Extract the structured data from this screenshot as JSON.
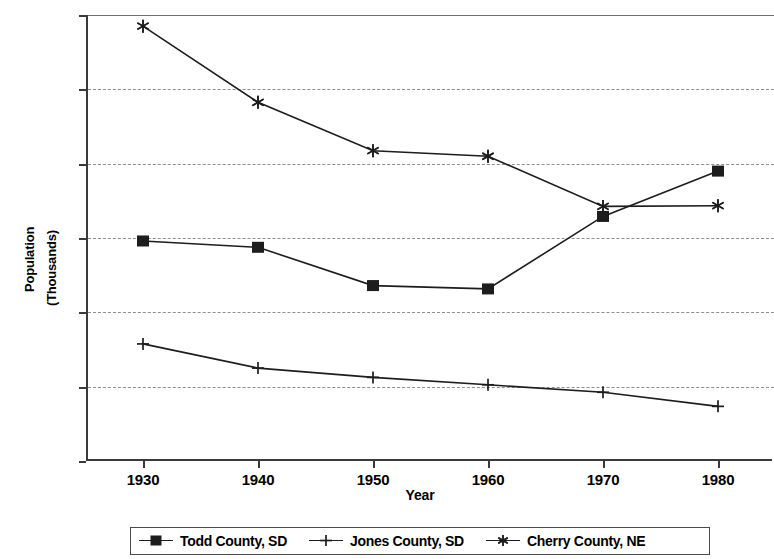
{
  "chart_data": {
    "type": "line",
    "title": "",
    "xlabel": "Year",
    "ylabel": "Population (Thousands)",
    "ylabel_lines": [
      "Population",
      "(Thousands)"
    ],
    "x": [
      1930,
      1940,
      1950,
      1960,
      1970,
      1980
    ],
    "xtick_labels": [
      "1930",
      "1940",
      "1950",
      "1960",
      "1970",
      "1980"
    ],
    "ytick_labels": [
      "0",
      "2",
      "4",
      "6",
      "8",
      "10",
      "12"
    ],
    "ytick_values": [
      0,
      2,
      4,
      6,
      8,
      10,
      12
    ],
    "ylim": [
      0,
      12
    ],
    "xlim": [
      1925,
      1985
    ],
    "grid": true,
    "grid_axis": "y",
    "legend_position": "bottom",
    "series": [
      {
        "name": "Todd County, SD",
        "marker": "filled-square",
        "values": [
          5.92,
          5.75,
          4.72,
          4.63,
          6.58,
          7.8
        ]
      },
      {
        "name": "Jones County, SD",
        "marker": "plus",
        "values": [
          3.15,
          2.5,
          2.25,
          2.05,
          1.85,
          1.47
        ]
      },
      {
        "name": "Cherry County, NE",
        "marker": "asterisk",
        "values": [
          11.7,
          9.65,
          8.35,
          8.2,
          6.85,
          6.87
        ]
      }
    ],
    "colors": {
      "line": "#1d1d1d",
      "grid": "#8e8e8e",
      "axis": "#3a3a3a",
      "background": "#ffffff"
    }
  }
}
